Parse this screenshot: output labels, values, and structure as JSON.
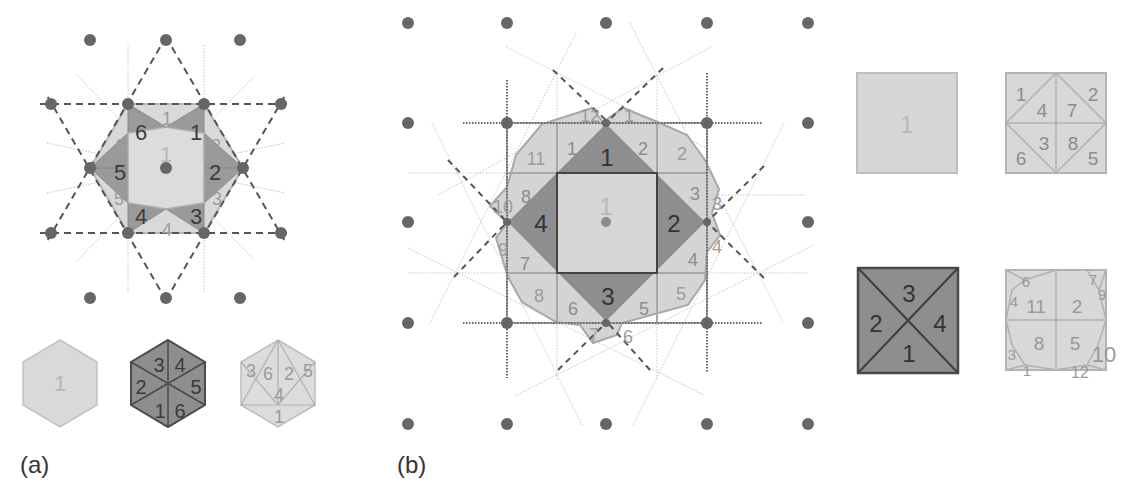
{
  "colors": {
    "dot": "#6a6a6a",
    "light_fill": "#d6d6d6",
    "light_stroke": "#b4b4b4",
    "mid_fill": "#b0b0b0",
    "dark_fill": "#8a8a8a",
    "dark_stroke": "#4a4a4a",
    "light_text": "#a6a6a6",
    "mid_text": "#8c8c8c",
    "dark_text": "#3c3c3c",
    "dash": "#555555",
    "dotted": "#bdbdbd"
  },
  "panel_a": {
    "caption": "(a)",
    "center_label": "1",
    "dark_triangle_labels": [
      "1",
      "2",
      "3",
      "4",
      "5",
      "6"
    ],
    "light_triangle_labels": [
      "1",
      "2",
      "3",
      "4",
      "5",
      "6"
    ],
    "legend": {
      "hex_light_label": "1",
      "hex_dark_labels": [
        "3",
        "4",
        "5",
        "6",
        "1",
        "2"
      ],
      "hex_split_labels": [
        "3",
        "6",
        "2",
        "5",
        "4",
        "1"
      ]
    }
  },
  "panel_b": {
    "caption": "(b)",
    "center_label": "1",
    "dark_triangle_labels": [
      "1",
      "2",
      "3",
      "4"
    ],
    "inner_ring_labels": [
      "1",
      "2",
      "3",
      "4",
      "5",
      "6",
      "7",
      "8"
    ],
    "outer_ring_labels": [
      "1",
      "2",
      "2",
      "3",
      "3",
      "4",
      "4",
      "5",
      "5",
      "6",
      "6",
      "7",
      "7",
      "8",
      "8",
      "9",
      "10",
      "11",
      "12"
    ],
    "legend": {
      "square_light_label": "1",
      "square_split8_labels": [
        "1",
        "4",
        "7",
        "2",
        "6",
        "3",
        "8",
        "5"
      ],
      "square_dark_labels": [
        "3",
        "2",
        "4",
        "1"
      ],
      "square_outer_labels": [
        "6",
        "4",
        "11",
        "2",
        "7",
        "9",
        "3",
        "8",
        "5",
        "1",
        "12",
        "10"
      ]
    }
  }
}
